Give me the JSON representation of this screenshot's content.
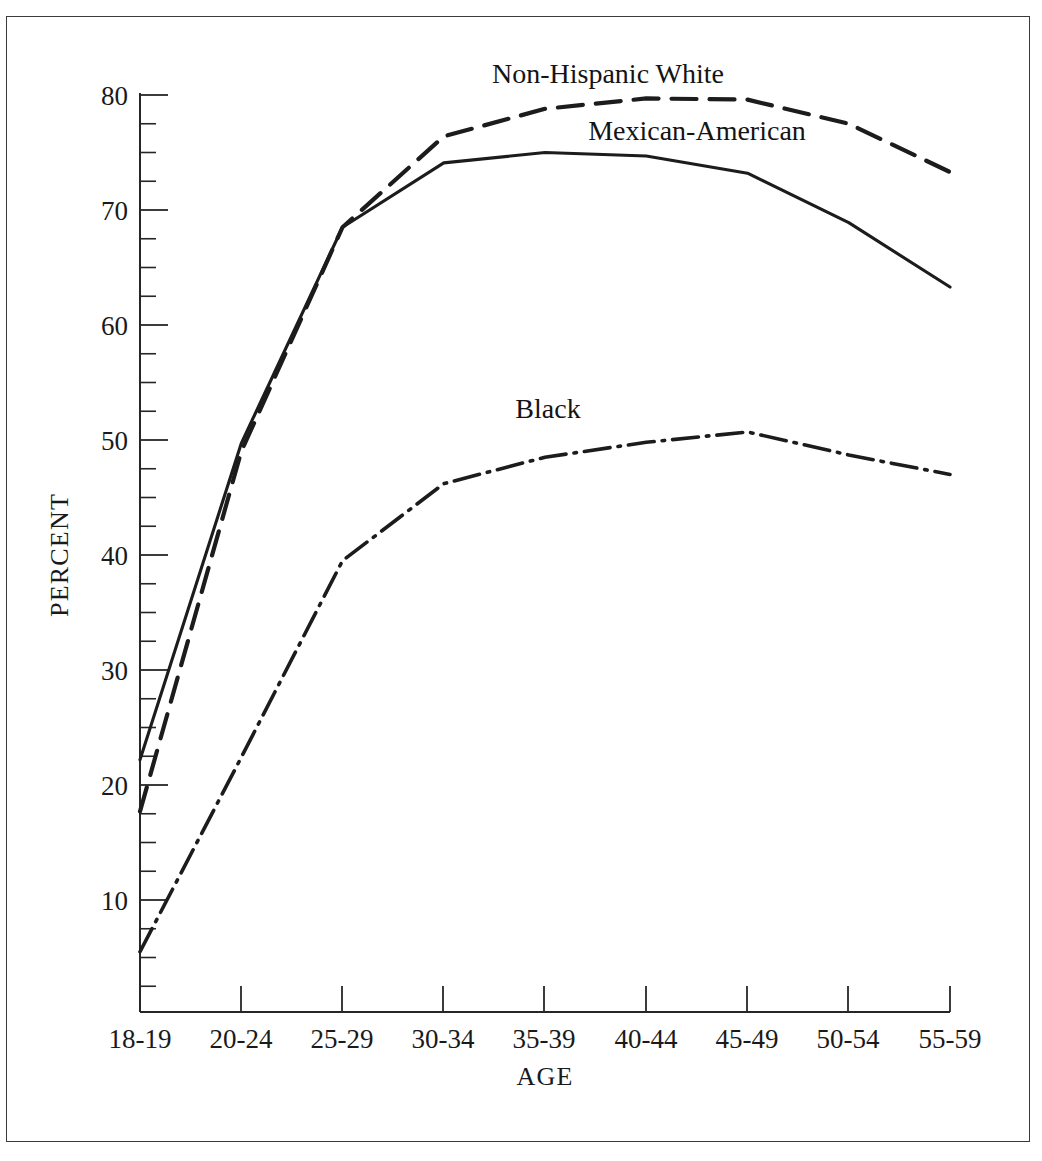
{
  "chart_data": {
    "type": "line",
    "title": "",
    "xlabel": "AGE",
    "ylabel": "PERCENT",
    "categories": [
      "18-19",
      "20-24",
      "25-29",
      "30-34",
      "35-39",
      "40-44",
      "45-49",
      "50-54",
      "55-59"
    ],
    "ylim": [
      0,
      80
    ],
    "y_ticks_major": [
      10,
      20,
      30,
      40,
      50,
      60,
      70,
      80
    ],
    "y_tick_labels": [
      "10",
      "20",
      "30",
      "40",
      "50",
      "60",
      "70",
      "80"
    ],
    "y_minor_interval": 2.5,
    "grid": false,
    "legend_position": "inline-annotations",
    "series": [
      {
        "name": "Non-Hispanic White",
        "style": "dashed",
        "color": "#1c1c1c",
        "values": [
          17.7,
          49.0,
          68.5,
          76.4,
          78.8,
          79.7,
          79.6,
          77.5,
          73.3
        ]
      },
      {
        "name": "Mexican-American",
        "style": "solid",
        "color": "#1c1c1c",
        "values": [
          22.2,
          49.7,
          68.5,
          74.1,
          75.0,
          74.7,
          73.2,
          68.9,
          63.3
        ]
      },
      {
        "name": "Black",
        "style": "dash-dot",
        "color": "#1c1c1c",
        "values": [
          5.5,
          22.4,
          39.5,
          46.2,
          48.5,
          49.8,
          50.7,
          48.7,
          47.0
        ]
      }
    ],
    "annotations": [
      {
        "text": "Non-Hispanic White",
        "series": "Non-Hispanic White"
      },
      {
        "text": "Mexican-American",
        "series": "Mexican-American"
      },
      {
        "text": "Black",
        "series": "Black"
      }
    ]
  },
  "axis": {
    "x_title": "AGE",
    "y_title": "PERCENT",
    "x_categories": [
      "18-19",
      "20-24",
      "25-29",
      "30-34",
      "35-39",
      "40-44",
      "45-49",
      "50-54",
      "55-59"
    ],
    "y_labels": [
      "80",
      "70",
      "60",
      "50",
      "40",
      "30",
      "20",
      "10"
    ]
  },
  "labels": {
    "nhw": "Non-Hispanic White",
    "mex": "Mexican-American",
    "black": "Black"
  }
}
